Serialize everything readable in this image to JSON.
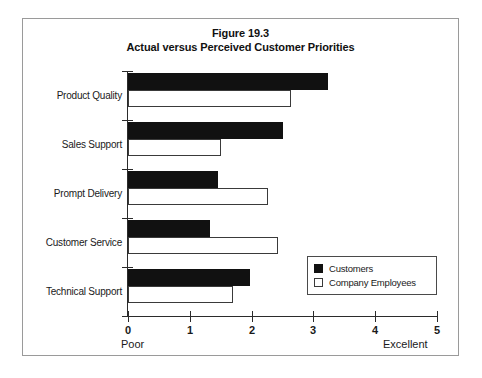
{
  "figure": {
    "frame_color": "#9a9a9a",
    "background": "#ffffff"
  },
  "chart_data": {
    "type": "bar",
    "orientation": "horizontal",
    "title": "Figure 19.3",
    "subtitle": "Actual versus Perceived Customer Priorities",
    "title_lines": [
      "Figure 19.3",
      "Actual versus Perceived Customer Priorities"
    ],
    "categories": [
      "Product Quality",
      "Sales Support",
      "Prompt Delivery",
      "Customer Service",
      "Technical Support"
    ],
    "series": [
      {
        "name": "Customers",
        "color": "#111111",
        "style": "filled",
        "values": [
          3.24,
          2.5,
          1.45,
          1.32,
          1.98
        ]
      },
      {
        "name": "Company Employees",
        "color": "#ffffff",
        "style": "outlined",
        "values": [
          2.64,
          1.5,
          2.27,
          2.42,
          1.7
        ]
      }
    ],
    "xlabel": "",
    "ylabel": "",
    "xlim": [
      0,
      5
    ],
    "xticks": [
      0,
      1,
      2,
      3,
      4,
      5
    ],
    "xtick_labels": [
      "0",
      "1",
      "2",
      "3",
      "4",
      "5"
    ],
    "axis_caption_low": "Poor",
    "axis_caption_high": "Excellent",
    "grid": false,
    "legend_position": "inside-bottom-right",
    "legend_entries": [
      "Customers",
      "Company Employees"
    ]
  }
}
